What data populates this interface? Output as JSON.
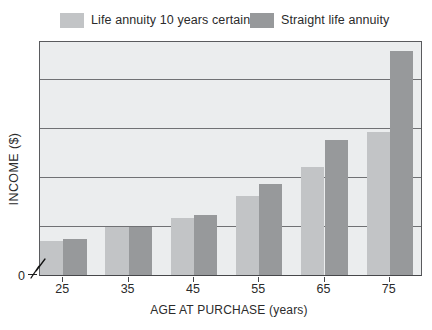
{
  "legend": {
    "items": [
      {
        "label": "Life annuity 10 years certain",
        "color": "#c2c4c6"
      },
      {
        "label": "Straight life annuity",
        "color": "#97999b"
      }
    ]
  },
  "y_axis": {
    "title": "INCOME ($)",
    "origin_label": "0"
  },
  "x_axis": {
    "title": "AGE AT PURCHASE (years)"
  },
  "chart_data": {
    "type": "bar",
    "categories": [
      "25",
      "35",
      "45",
      "55",
      "65",
      "75"
    ],
    "series": [
      {
        "name": "Life annuity 10 years certain",
        "color": "#c2c4c6",
        "values": [
          0.7,
          0.98,
          1.16,
          1.62,
          2.22,
          2.94
        ]
      },
      {
        "name": "Straight life annuity",
        "color": "#97999b",
        "values": [
          0.73,
          0.98,
          1.24,
          1.86,
          2.77,
          4.6
        ]
      }
    ],
    "xlabel": "AGE AT PURCHASE (years)",
    "ylabel": "INCOME ($)",
    "ylim": [
      0,
      4.82
    ],
    "y_gridlines": [
      1,
      2,
      3,
      4
    ],
    "grid": true,
    "legend_position": "top",
    "y_scale_note": "Y axis shows only '0' with a break mark; no numeric ticks. Values are in gridline units estimated from bar heights."
  }
}
